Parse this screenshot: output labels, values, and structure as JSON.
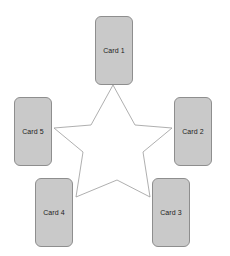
{
  "canvas": {
    "width": 230,
    "height": 256,
    "background_color": "#ffffff"
  },
  "diagram": {
    "type": "star-layout",
    "shape_name": "five-pointed-star",
    "star": {
      "stroke_color": "#9a9a9a",
      "fill_color": "#ffffff",
      "stroke_width": 0.8,
      "center_x": 113,
      "center_y": 143,
      "points": 5,
      "outer_points": [
        {
          "x": 113,
          "y": 85
        },
        {
          "x": 172,
          "y": 128
        },
        {
          "x": 150,
          "y": 197
        },
        {
          "x": 76,
          "y": 197
        },
        {
          "x": 54,
          "y": 128
        }
      ],
      "inner_points": [
        {
          "x": 135,
          "y": 125
        },
        {
          "x": 143,
          "y": 152
        },
        {
          "x": 117,
          "y": 180
        },
        {
          "x": 83,
          "y": 152
        },
        {
          "x": 91,
          "y": 125
        }
      ]
    },
    "card_style": {
      "fill_color": "#c9c9c9",
      "border_color": "#8e8e8e",
      "text_color": "#1c1c1c",
      "corner_radius": 6,
      "width": 38,
      "height": 69
    },
    "cards": [
      {
        "id": "card-1",
        "label": "Card 1",
        "position": "top",
        "x": 95,
        "y": 16
      },
      {
        "id": "card-2",
        "label": "Card 2",
        "position": "right",
        "x": 174,
        "y": 97
      },
      {
        "id": "card-3",
        "label": "Card 3",
        "position": "bottom-right",
        "x": 152,
        "y": 178
      },
      {
        "id": "card-4",
        "label": "Card 4",
        "position": "bottom-left",
        "x": 35,
        "y": 178
      },
      {
        "id": "card-5",
        "label": "Card 5",
        "position": "left",
        "x": 14,
        "y": 97
      }
    ]
  }
}
